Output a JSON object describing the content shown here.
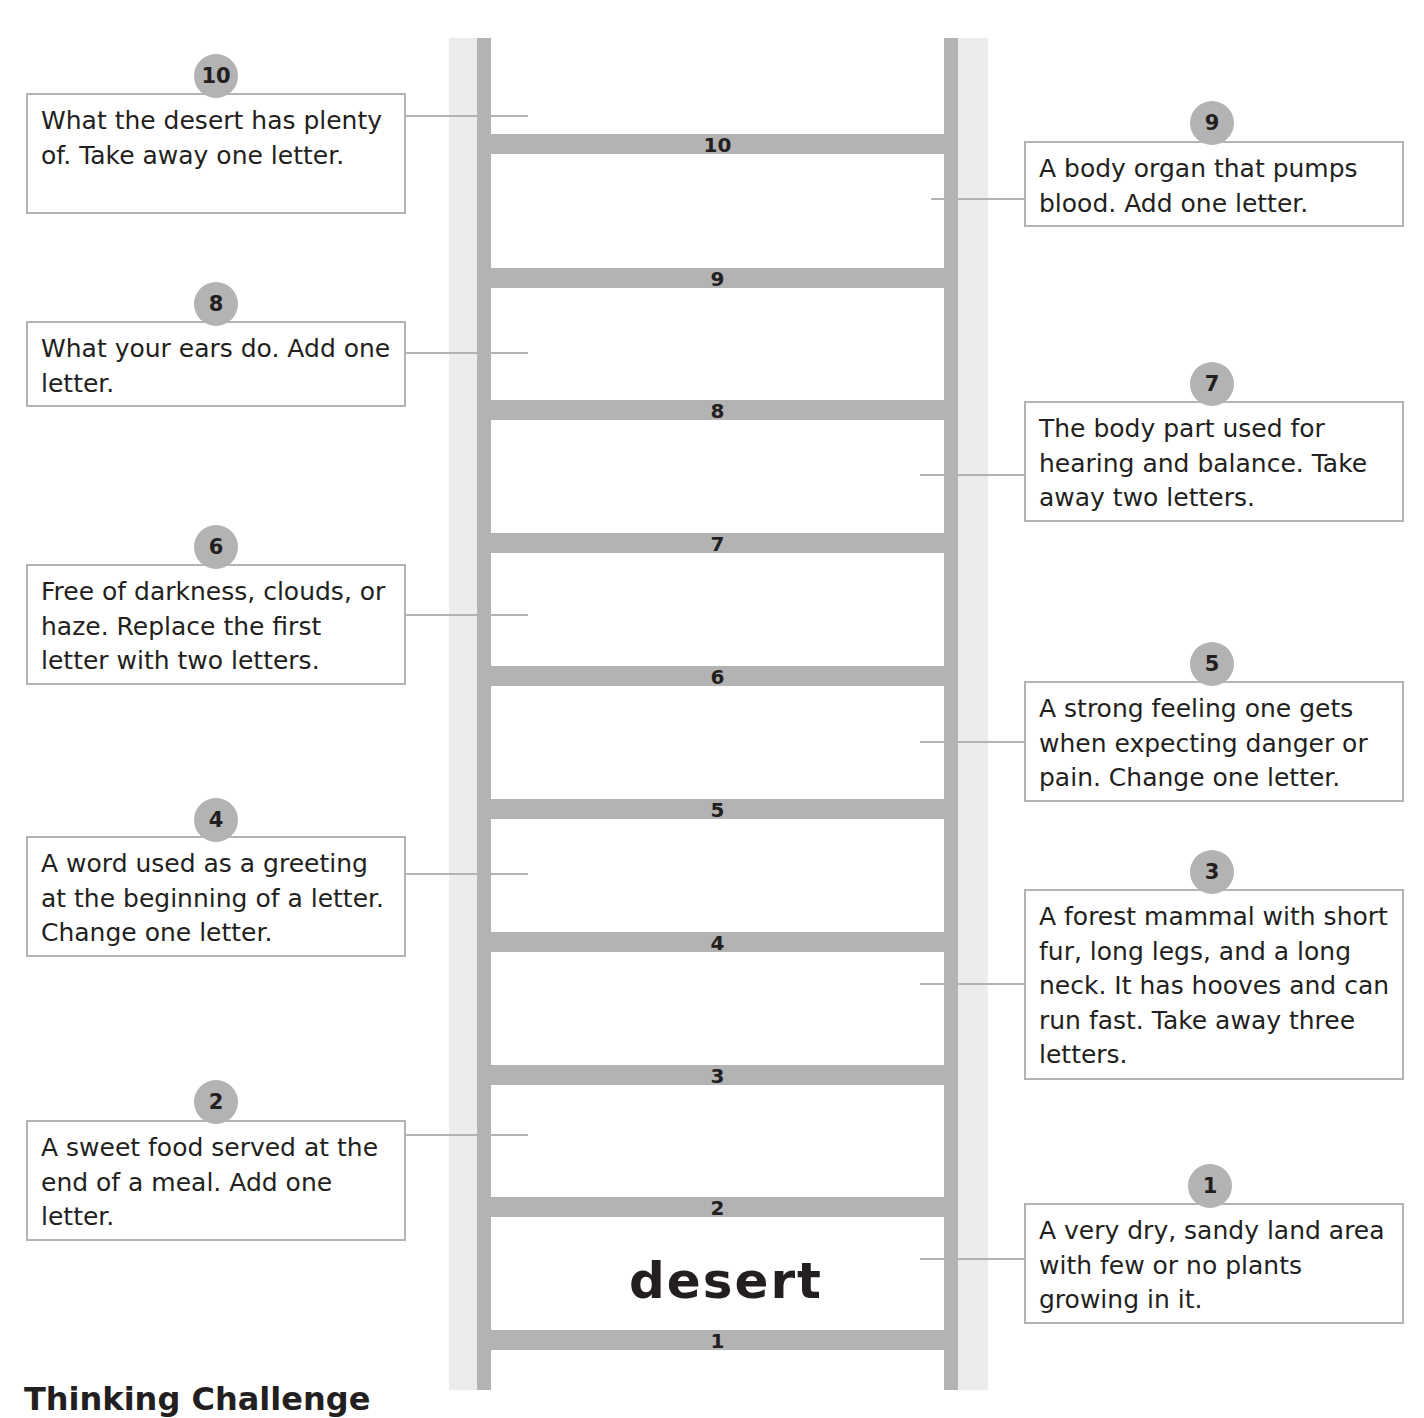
{
  "start_word": "desert",
  "rungs": [
    {
      "label": "1",
      "top": 1330
    },
    {
      "label": "2",
      "top": 1197
    },
    {
      "label": "3",
      "top": 1065
    },
    {
      "label": "4",
      "top": 932
    },
    {
      "label": "5",
      "top": 799
    },
    {
      "label": "6",
      "top": 666
    },
    {
      "label": "7",
      "top": 533
    },
    {
      "label": "8",
      "top": 400
    },
    {
      "label": "9",
      "top": 268
    },
    {
      "label": "10",
      "top": 134
    }
  ],
  "clues": {
    "c1": {
      "number": "1",
      "text": "A very dry, sandy land area with few or no plants growing in it."
    },
    "c2": {
      "number": "2",
      "text": "A sweet food served at the end of a meal.  Add one letter."
    },
    "c3": {
      "number": "3",
      "text": "A forest mammal with short fur, long legs, and a long neck.  It has hooves and can run fast. Take away three letters."
    },
    "c4": {
      "number": "4",
      "text": "A word used as a greeting at the beginning of a letter.  Change one letter."
    },
    "c5": {
      "number": "5",
      "text": "A strong feeling one gets when expecting danger or pain.  Change one letter."
    },
    "c6": {
      "number": "6",
      "text": "Free of darkness, clouds, or haze.  Replace the first letter with two letters."
    },
    "c7": {
      "number": "7",
      "text": "The body part used for hearing and balance.  Take away two letters."
    },
    "c8": {
      "number": "8",
      "text": "What your ears do.  Add one letter."
    },
    "c9": {
      "number": "9",
      "text": "A body organ that pumps blood.  Add one letter."
    },
    "c10": {
      "number": "10",
      "text": "What the desert has plenty of.  Take away one letter."
    }
  },
  "section_title": "Thinking Challenge",
  "colors": {
    "ladder_gray": "#b3b3b3",
    "rail_light": "#ececec",
    "text": "#231f20"
  }
}
